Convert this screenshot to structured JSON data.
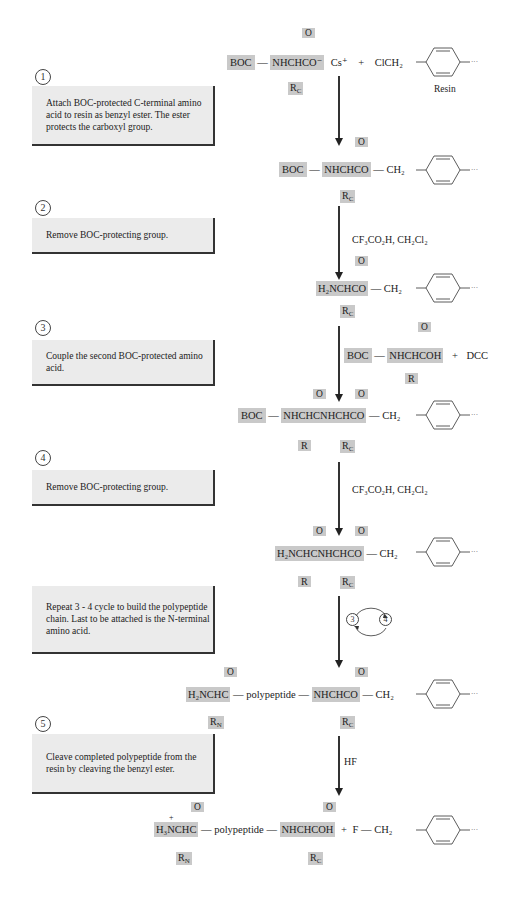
{
  "steps": [
    {
      "number": "1",
      "text": "Attach BOC-protected C-terminal amino acid to resin as benzyl ester. The ester protects the carboxyl group."
    },
    {
      "number": "2",
      "text": "Remove BOC-protecting group."
    },
    {
      "number": "3",
      "text": "Couple the second BOC-protected amino acid."
    },
    {
      "number": "4",
      "text": "Remove BOC-protecting group."
    },
    {
      "number": "",
      "text": "Repeat 3 - 4 cycle to build the polypeptide chain. Last to be attached is the N-terminal amino acid."
    },
    {
      "number": "5",
      "text": "Cleave completed polypeptide from the resin by cleaving the benzyl ester."
    }
  ],
  "structures": {
    "s1": {
      "boc": "BOC",
      "core": "NHCHCO⁻",
      "o": "O",
      "r": "R",
      "r_sub": "C",
      "counterion": "Cs⁺",
      "plus": "+",
      "reagent": "ClCH₂",
      "resin_label": "Resin"
    },
    "s2": {
      "boc": "BOC",
      "core": "NHCHCO",
      "o": "O",
      "r": "R",
      "r_sub": "C",
      "linker": "CH₂"
    },
    "s3": {
      "core": "H₂NCHCO",
      "o": "O",
      "r": "R",
      "r_sub": "C",
      "linker": "CH₂"
    },
    "s3_reagent": {
      "boc": "BOC",
      "core": "NHCHCOH",
      "o": "O",
      "r": "R",
      "plus": "+",
      "dcc": "DCC"
    },
    "s4": {
      "boc": "BOC",
      "core": "NHCHCNHCHCO",
      "o": "O",
      "r1": "R",
      "r2": "R",
      "r2_sub": "C",
      "linker": "CH₂"
    },
    "s5": {
      "core": "H₂NCHCNHCHCO",
      "o": "O",
      "r1": "R",
      "r2": "R",
      "r2_sub": "C",
      "linker": "CH₂"
    },
    "s6": {
      "nterm": "H₂NCHC",
      "o": "O",
      "rn": "R",
      "rn_sub": "N",
      "chain": "polypeptide",
      "cterm": "NHCHCO",
      "rc": "R",
      "rc_sub": "C",
      "linker": "CH₂"
    },
    "s7": {
      "charge": "+",
      "nterm": "H₃NCHC",
      "o": "O",
      "rn": "R",
      "rn_sub": "N",
      "chain": "polypeptide",
      "cterm": "NHCHCOH",
      "rc": "R",
      "rc_sub": "C",
      "plus": "+",
      "f": "F",
      "linker": "CH₂"
    }
  },
  "reagents": {
    "deprotect1": "CF₃CO₂H, CH₂Cl₂",
    "deprotect2": "CF₃CO₂H, CH₂Cl₂",
    "cleave": "HF",
    "cycle_a": "3",
    "cycle_b": "4"
  }
}
